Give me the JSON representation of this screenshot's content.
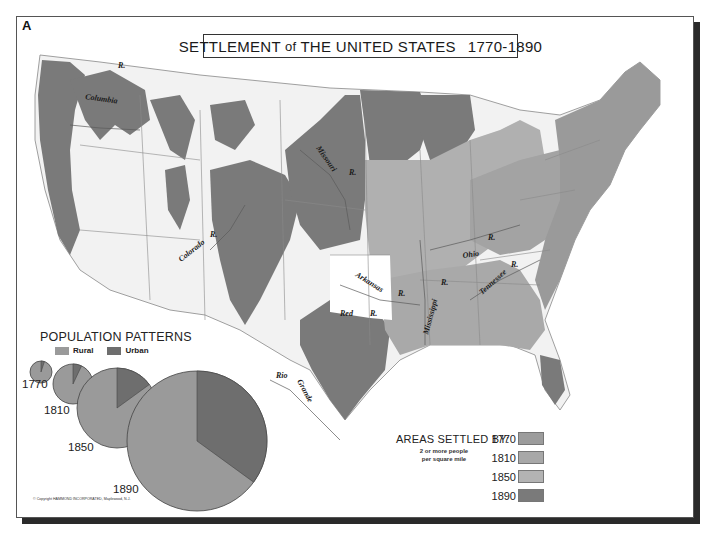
{
  "plate_letter": "A",
  "title": {
    "part1": "SETTLEMENT",
    "part2": "of",
    "part3": "THE UNITED STATES",
    "years": "1770-1890"
  },
  "rivers": [
    {
      "name": "Columbia",
      "label": "Columbia"
    },
    {
      "name": "Columbia-R",
      "label": "R."
    },
    {
      "name": "Missouri",
      "label": "Missouri"
    },
    {
      "name": "Missouri-R",
      "label": "R."
    },
    {
      "name": "Colorado",
      "label": "Colorado"
    },
    {
      "name": "Colorado-R",
      "label": "R."
    },
    {
      "name": "Arkansas",
      "label": "Arkansas"
    },
    {
      "name": "Arkansas-R",
      "label": "R."
    },
    {
      "name": "Red",
      "label": "Red"
    },
    {
      "name": "Red-R",
      "label": "R."
    },
    {
      "name": "Mississippi",
      "label": "Mississippi"
    },
    {
      "name": "Mississippi-R",
      "label": "R."
    },
    {
      "name": "Ohio",
      "label": "Ohio"
    },
    {
      "name": "Ohio-R",
      "label": "R."
    },
    {
      "name": "Tennessee",
      "label": "Tennessee"
    },
    {
      "name": "Tennessee-R",
      "label": "R."
    },
    {
      "name": "Rio",
      "label": "Rio"
    },
    {
      "name": "Grande",
      "label": "Grande"
    }
  ],
  "population_patterns": {
    "title": "POPULATION PATTERNS",
    "legend": [
      {
        "label": "Rural",
        "color": "#9a9a9a"
      },
      {
        "label": "Urban",
        "color": "#6e6e6e"
      }
    ]
  },
  "chart_data": {
    "type": "pie",
    "title": "POPULATION PATTERNS",
    "legend": [
      "Rural",
      "Urban"
    ],
    "legend_position": "top",
    "pies": [
      {
        "year": "1770",
        "rural_pct": 95,
        "urban_pct": 5,
        "relative_size": 11
      },
      {
        "year": "1810",
        "rural_pct": 93,
        "urban_pct": 7,
        "relative_size": 20
      },
      {
        "year": "1850",
        "rural_pct": 85,
        "urban_pct": 15,
        "relative_size": 40
      },
      {
        "year": "1890",
        "rural_pct": 65,
        "urban_pct": 35,
        "relative_size": 70
      }
    ]
  },
  "pie_labels": [
    "1770",
    "1810",
    "1850",
    "1890"
  ],
  "copyright": "© Copyright HAMMOND INCORPORATED, Maplewood, N.J.",
  "areas_settled": {
    "title": "AREAS SETTLED BY:",
    "subtitle_line1": "2 or more people",
    "subtitle_line2": "per square mile",
    "rows": [
      {
        "year": "1770",
        "color": "#9c9c9c"
      },
      {
        "year": "1810",
        "color": "#a8a8a8"
      },
      {
        "year": "1850",
        "color": "#b3b3b3"
      },
      {
        "year": "1890",
        "color": "#7a7a7a"
      }
    ]
  },
  "colors": {
    "settled_1770": "#9c9c9c",
    "settled_1810": "#a8a8a8",
    "settled_1850": "#b3b3b3",
    "settled_1890": "#7a7a7a",
    "unsettled": "#f4f4f4",
    "rural": "#9a9a9a",
    "urban": "#6e6e6e"
  }
}
